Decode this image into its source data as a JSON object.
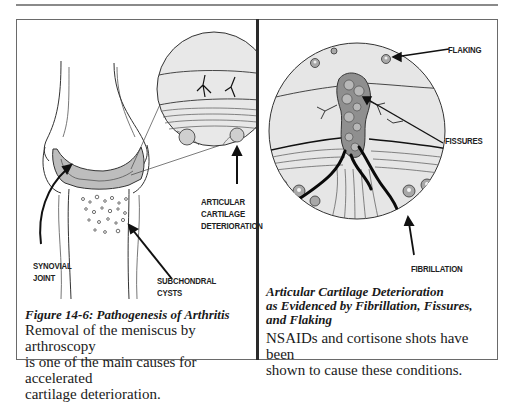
{
  "left_figure": {
    "labels": {
      "articular": [
        "Articular",
        "Cartilage",
        "Deterioration"
      ],
      "synovial": [
        "Synovial",
        "Joint"
      ],
      "subchondral": [
        "Subchondral",
        "Cysts"
      ]
    },
    "caption_title": "Figure 14-6: Pathogenesis of Arthritis",
    "caption_body": [
      "Removal of the meniscus by arthroscopy",
      "is one of the main causes for accelerated",
      "cartilage deterioration."
    ]
  },
  "right_figure": {
    "labels": {
      "flaking": "Flaking",
      "fissures": "Fissures",
      "fibrillation": "Fibrillation"
    },
    "caption_title": [
      "Articular Cartilage Deterioration",
      "as Evidenced by Fibrillation, Fissures,",
      "and Flaking"
    ],
    "caption_body": [
      "NSAIDs and cortisone shots have been",
      "shown to cause these conditions."
    ]
  },
  "colors": {
    "ink": "#1a1a1a",
    "cartilage_gray": "#bdbdbd",
    "circle_fill": "#e6e6e6",
    "cell_gray": "#9a9a9a",
    "rule_gray": "#8a8a8a"
  }
}
